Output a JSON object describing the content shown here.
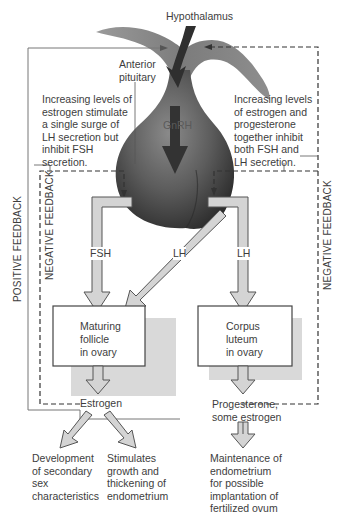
{
  "diagram": {
    "title_labels": {
      "hypothalamus": "Hypothalamus",
      "anterior_pituitary": "Anterior\npituitary",
      "gnrh": "GnRH"
    },
    "annotations": {
      "left_note": "Increasing levels of\nestrogen stimulate\na single surge of\nLH secretion but\ninhibit FSH\nsecretion.",
      "right_note": "Increasing levels\nof estrogen and\nprogesterone\ntogether inhibit\nboth FSH and\nLH secretion."
    },
    "feedback_labels": {
      "positive": "POSITIVE FEEDBACK",
      "negative_left": "NEGATIVE FEEDBACK",
      "negative_right": "NEGATIVE FEEDBACK"
    },
    "hormone_arrows": {
      "fsh": "FSH",
      "lh_diagonal": "LH",
      "lh_right": "LH"
    },
    "boxes": {
      "left": "Maturing\nfollicle\nin ovary",
      "right": "Corpus\nluteum\nin ovary"
    },
    "outputs": {
      "estrogen": "Estrogen",
      "progesterone": "Progesterone,\nsome estrogen"
    },
    "effects": {
      "secondary_sex": "Development\nof secondary\nsex\ncharacteristics",
      "endometrium_growth": "Stimulates\ngrowth and\nthickening of\nendometrium",
      "endometrium_maintenance": "Maintenance of\nendometrium\nfor possible\nimplantation of\nfertilized ovum"
    },
    "colors": {
      "pituitary_dark": "#3e3e3e",
      "pituitary_light": "#8a8a8a",
      "arrow_fill": "#d4d4d4",
      "arrow_stroke": "#555555",
      "box_shadow": "#d9d9d9",
      "line": "#4a4a4a"
    }
  }
}
